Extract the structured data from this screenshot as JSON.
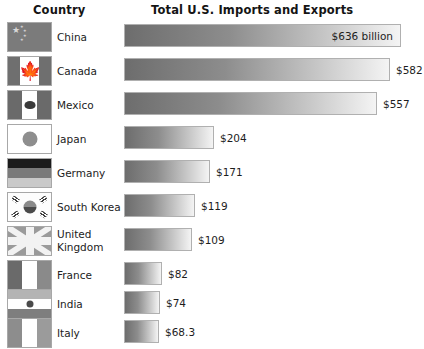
{
  "header": {
    "country_label": "Country",
    "value_label": "Total U.S. Imports and Exports"
  },
  "chart_data": {
    "type": "bar",
    "title": "Total U.S. Imports and Exports",
    "xlabel": "",
    "ylabel": "Country",
    "orientation": "horizontal",
    "unit": "billions of U.S. dollars",
    "grid": false,
    "legend": false,
    "xlim": [
      0,
      636
    ],
    "categories": [
      "China",
      "Canada",
      "Mexico",
      "Japan",
      "Germany",
      "South Korea",
      "United Kingdom",
      "France",
      "India",
      "Italy"
    ],
    "values": [
      636,
      582,
      557,
      204,
      171,
      119,
      109,
      82,
      74,
      68.3
    ],
    "value_labels": [
      "$636 billion",
      "$582",
      "$557",
      "$204",
      "$171",
      "$119",
      "$109",
      "$82",
      "$74",
      "$68.3"
    ]
  },
  "rows": [
    {
      "country": "China",
      "country_line2": "",
      "value_label": "$636 billion",
      "value": 636,
      "bar_width_px": 277,
      "label_inside": true,
      "flag": "flag-china",
      "top": 22
    },
    {
      "country": "Canada",
      "country_line2": "",
      "value_label": "$582",
      "value": 582,
      "bar_width_px": 266,
      "label_inside": false,
      "flag": "flag-canada",
      "top": 56
    },
    {
      "country": "Mexico",
      "country_line2": "",
      "value_label": "$557",
      "value": 557,
      "bar_width_px": 253,
      "label_inside": false,
      "flag": "flag-mexico",
      "top": 90
    },
    {
      "country": "Japan",
      "country_line2": "",
      "value_label": "$204",
      "value": 204,
      "bar_width_px": 90,
      "label_inside": false,
      "flag": "flag-japan",
      "top": 124
    },
    {
      "country": "Germany",
      "country_line2": "",
      "value_label": "$171",
      "value": 171,
      "bar_width_px": 86,
      "label_inside": false,
      "flag": "flag-germany",
      "top": 158
    },
    {
      "country": "South Korea",
      "country_line2": "",
      "value_label": "$119",
      "value": 119,
      "bar_width_px": 71,
      "label_inside": false,
      "flag": "flag-south-korea",
      "top": 192
    },
    {
      "country": "United",
      "country_line2": "Kingdom",
      "value_label": "$109",
      "value": 109,
      "bar_width_px": 68,
      "label_inside": false,
      "flag": "flag-united-kingdom",
      "top": 226
    },
    {
      "country": "France",
      "country_line2": "",
      "value_label": "$82",
      "value": 82,
      "bar_width_px": 38,
      "label_inside": false,
      "flag": "flag-france",
      "top": 260
    },
    {
      "country": "India",
      "country_line2": "",
      "value_label": "$74",
      "value": 74,
      "bar_width_px": 36,
      "label_inside": false,
      "flag": "flag-india",
      "top": 289
    },
    {
      "country": "Italy",
      "country_line2": "",
      "value_label": "$68.3",
      "value": 68.3,
      "bar_width_px": 35,
      "label_inside": false,
      "flag": "flag-italy",
      "top": 318
    }
  ],
  "colors": {
    "bar_start": "#6d6d6d",
    "bar_end": "#f4f4f4",
    "bar_border": "#b0b0b0",
    "text": "#1d1d1d",
    "background": "#ffffff"
  }
}
